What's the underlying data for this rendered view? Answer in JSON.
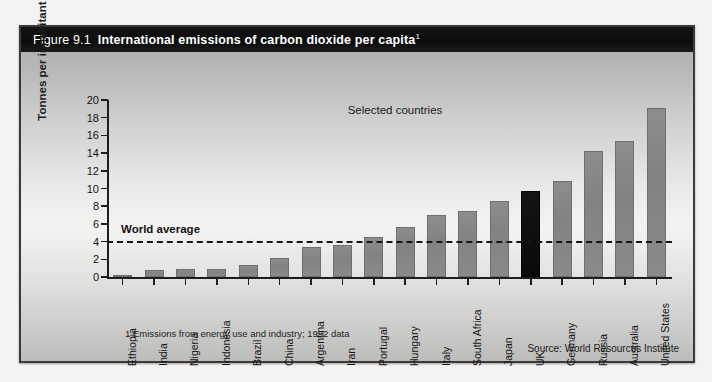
{
  "figure": {
    "number": "Figure 9.1",
    "title": "International emissions of carbon dioxide per capita",
    "title_footnote_marker": "1",
    "subtitle": "Selected countries",
    "footnote": "1 Emissions from energy use and industry; 1992 data",
    "source": "Source: World Resources Institute"
  },
  "annotations": {
    "world_average_label": "World average"
  },
  "colors": {
    "bar": "#858585",
    "highlight_bar": "#0d0d0d",
    "title_bar": "#101010",
    "axis": "#1d1d1d",
    "frame": "#3a3a3a"
  },
  "chart_data": {
    "type": "bar",
    "title": "International emissions of carbon dioxide per capita",
    "subtitle": "Selected countries",
    "xlabel": "",
    "ylabel": "Tonnes per inhabitant",
    "ylim": [
      0,
      20
    ],
    "yticks": [
      0,
      2,
      4,
      6,
      8,
      10,
      12,
      14,
      16,
      18,
      20
    ],
    "ytick_labels": [
      "0",
      "2",
      "4",
      "6",
      "8",
      "10",
      "12",
      "14",
      "16",
      "18",
      "20"
    ],
    "grid": false,
    "legend": null,
    "highlight_category": "UK",
    "categories": [
      "Ethiopia",
      "India",
      "Nigeria",
      "Indonesia",
      "Brazil",
      "China",
      "Argentina",
      "Iran",
      "Portugal",
      "Hungary",
      "Italy",
      "South Africa",
      "Japan",
      "UK",
      "Germany",
      "Russia",
      "Australia",
      "United States"
    ],
    "values": [
      0.05,
      0.8,
      0.85,
      0.95,
      1.4,
      2.2,
      3.4,
      3.6,
      4.5,
      5.7,
      7.0,
      7.5,
      8.6,
      9.7,
      10.8,
      14.2,
      15.4,
      19.1
    ],
    "reference_lines": [
      {
        "label": "World average",
        "value": 4.1,
        "style": "dashed"
      }
    ]
  }
}
